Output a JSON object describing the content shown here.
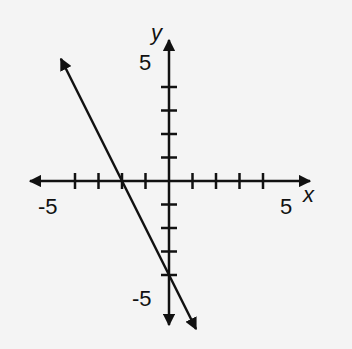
{
  "chart_data": {
    "type": "line",
    "title": "",
    "xlabel": "x",
    "ylabel": "y",
    "xlim": [
      -5,
      5
    ],
    "ylim": [
      -5,
      5
    ],
    "grid": false,
    "tick_labels": {
      "x_min": "-5",
      "x_max": "5",
      "y_min": "-5",
      "y_max": "5"
    },
    "x_ticks": [
      -4,
      -3,
      -2,
      -1,
      1,
      2,
      3,
      4
    ],
    "y_ticks": [
      -4,
      -3,
      -2,
      -1,
      1,
      2,
      3,
      4
    ],
    "series": [
      {
        "name": "line",
        "equation": "y = -2x - 4",
        "slope": -2,
        "intercept": -4,
        "x_intercept": -2,
        "points": [
          [
            -2,
            0
          ],
          [
            0,
            -4
          ]
        ],
        "arrows_both_ends": true
      }
    ]
  },
  "colors": {
    "background": "#f4f4f4",
    "ink": "#111111"
  }
}
